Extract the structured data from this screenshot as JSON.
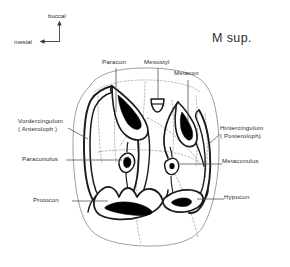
{
  "figure": {
    "title": "M sup.",
    "caption_type": "dental-anatomy-diagram"
  },
  "orientation": {
    "up_label": "buccal",
    "left_label": "mesial"
  },
  "labels": {
    "paracon": "Paracon",
    "mesostyl": "Mesostyl",
    "metacon": "Metacon",
    "vordercingulum_line1": "Vordercingulum",
    "vordercingulum_line2": "( Anteroloph )",
    "hintercingulum_line1": "Hintercingulum",
    "hintercingulum_line2": "( Posteroloph)",
    "paraconulus": "Paraconulus",
    "metaconulus": "Metaconulus",
    "protocon": "Protocon",
    "hypocon": "Hypocon"
  },
  "colors": {
    "ink": "#1a1a1a",
    "label_text": "#2b2b2b",
    "leader": "#555555",
    "dotted": "#9b9b9b",
    "outline": "#8a8a8a",
    "fill_wear_facet": "#000000",
    "background": "#ffffff"
  }
}
